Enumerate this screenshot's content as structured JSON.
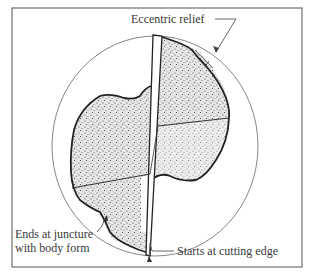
{
  "figure": {
    "type": "drill point cross-section with eccentric relief",
    "labels": {
      "eccentric_relief": "Eccentric relief",
      "ends_line1": "Ends at juncture",
      "ends_line2": "with body form",
      "starts": "Starts at cutting edge"
    },
    "colors": {
      "line": "#2a2a2a",
      "thin_line": "#666666",
      "stipple_fill": "#cfcfcf",
      "background": "#ffffff"
    }
  }
}
